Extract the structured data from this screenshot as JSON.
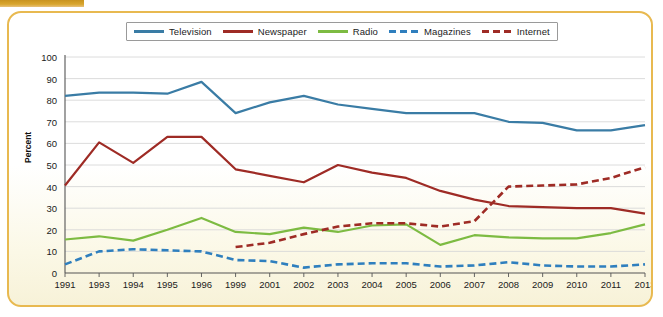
{
  "chart_data": {
    "type": "line",
    "title": "",
    "xlabel": "",
    "ylabel": "Percent",
    "ylim": [
      0,
      100
    ],
    "ytick_step": 10,
    "yticks": [
      0,
      10,
      20,
      30,
      40,
      50,
      60,
      70,
      80,
      90,
      100
    ],
    "grid": true,
    "legend_position": "top-center",
    "categories": [
      "1991",
      "1993",
      "1994",
      "1995",
      "1996",
      "1999",
      "2001",
      "2002",
      "2003",
      "2004",
      "2005",
      "2006",
      "2007",
      "2008",
      "2009",
      "2010",
      "2011",
      "2013"
    ],
    "series": [
      {
        "name": "Television",
        "color": "#3a7ca5",
        "style": "solid",
        "values": [
          82,
          83.5,
          83.5,
          83,
          88.5,
          74,
          79,
          82,
          78,
          76,
          74,
          74,
          74,
          70,
          69.5,
          66,
          66,
          68.5
        ]
      },
      {
        "name": "Newspaper",
        "color": "#9e2b25",
        "style": "solid",
        "values": [
          40.5,
          60.5,
          51,
          63,
          63,
          48,
          45,
          42,
          50,
          46.5,
          44,
          38,
          34,
          31,
          30.5,
          30,
          30,
          27.5
        ]
      },
      {
        "name": "Radio",
        "color": "#7dbb42",
        "style": "solid",
        "values": [
          15.5,
          17,
          15,
          20,
          25.5,
          19,
          18,
          21,
          19,
          22,
          22.5,
          13,
          17.5,
          16.5,
          16,
          16,
          18.5,
          22.5
        ]
      },
      {
        "name": "Magazines",
        "color": "#2f7fbe",
        "style": "dashed",
        "values": [
          4,
          10,
          11,
          10.5,
          10,
          6,
          5.5,
          2.5,
          4,
          4.5,
          4.5,
          3,
          3.5,
          5,
          3.5,
          3,
          3,
          4
        ]
      },
      {
        "name": "Internet",
        "color": "#9e2b25",
        "style": "dashed",
        "values": [
          null,
          null,
          null,
          null,
          null,
          12,
          14,
          18,
          21.5,
          23,
          23,
          21.5,
          24,
          40,
          40.5,
          41,
          44,
          49
        ]
      }
    ]
  },
  "legend": {
    "items": [
      {
        "label": "Television",
        "color": "#3a7ca5",
        "style": "solid"
      },
      {
        "label": "Newspaper",
        "color": "#9e2b25",
        "style": "solid"
      },
      {
        "label": "Radio",
        "color": "#7dbb42",
        "style": "solid"
      },
      {
        "label": "Magazines",
        "color": "#2f7fbe",
        "style": "dashed"
      },
      {
        "label": "Internet",
        "color": "#9e2b25",
        "style": "dashed"
      }
    ]
  },
  "theme": {
    "frame_border": "#e8b950",
    "top_bar": "#d9a62e",
    "grid_line": "#d8d8d8",
    "axis_line": "#555555",
    "text": "#1b1b1b"
  }
}
